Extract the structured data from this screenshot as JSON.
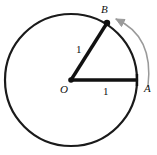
{
  "figure": {
    "kind": "geometry-diagram",
    "width": 157,
    "height": 155,
    "background_color": "#ffffff"
  },
  "colors": {
    "stroke": "#1a1a1a",
    "radius_stroke": "#111111",
    "arrow": "#9a9a9a",
    "point_fill": "#111111",
    "label": "#111111"
  },
  "circle": {
    "center_x": 71,
    "center_y": 80,
    "radius": 66,
    "stroke_width": 2.2
  },
  "points": [
    {
      "id": "O",
      "label": "O",
      "x": 71,
      "y": 80,
      "dot": true,
      "label_dx": -11,
      "label_dy": 4
    },
    {
      "id": "A",
      "label": "A",
      "x": 137,
      "y": 80,
      "dot": false,
      "label_dx": 7,
      "label_dy": 3
    },
    {
      "id": "B",
      "label": "B",
      "x": 107,
      "y": 22,
      "dot": true,
      "label_dx": -6,
      "label_dy": -18
    }
  ],
  "segments": [
    {
      "id": "OA",
      "from": "O",
      "to": "A",
      "length_label": "1",
      "stroke_width": 3.2
    },
    {
      "id": "OB",
      "from": "O",
      "to": "B",
      "length_label": "1",
      "stroke_width": 3.2
    }
  ],
  "length_labels": [
    {
      "id": "len-radius-oa",
      "text": "1",
      "for_segment": "OA"
    },
    {
      "id": "len-radius-ob",
      "text": "1",
      "for_segment": "OB"
    }
  ],
  "arc_arrow": {
    "id": "arc-arrow-a-to-b",
    "from_point": "A",
    "to_point": "B",
    "direction": "counterclockwise",
    "color": "#9a9a9a",
    "stroke_width": 1.4,
    "start_x": 148,
    "start_y": 84,
    "end_x": 114,
    "end_y": 18,
    "control_x": 152,
    "control_y": 30,
    "arrowhead_size": 7
  },
  "tick_marks": [
    {
      "id": "tick-at-a",
      "x": 137,
      "y": 80,
      "half_length": 6,
      "orientation": "vertical",
      "stroke_width": 2.4
    }
  ]
}
